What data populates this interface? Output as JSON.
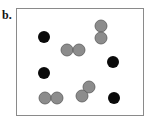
{
  "panel": {
    "label": "b.",
    "colors": {
      "black_particle": "#0a0a0a",
      "gray_particle": "#8c8c8c",
      "gray_stroke": "#5a5a5a",
      "frame": "#8a8a8a"
    },
    "particle_radius": 6,
    "black_particles": [
      {
        "x": 44,
        "y": 37
      },
      {
        "x": 113,
        "y": 62
      },
      {
        "x": 44,
        "y": 73
      },
      {
        "x": 114,
        "y": 98
      }
    ],
    "gray_pairs": [
      [
        {
          "x": 67,
          "y": 50
        },
        {
          "x": 79,
          "y": 50
        }
      ],
      [
        {
          "x": 101,
          "y": 26
        },
        {
          "x": 101,
          "y": 38
        }
      ],
      [
        {
          "x": 45,
          "y": 98
        },
        {
          "x": 57,
          "y": 98
        }
      ],
      [
        {
          "x": 89,
          "y": 87
        },
        {
          "x": 82,
          "y": 96
        }
      ]
    ]
  }
}
